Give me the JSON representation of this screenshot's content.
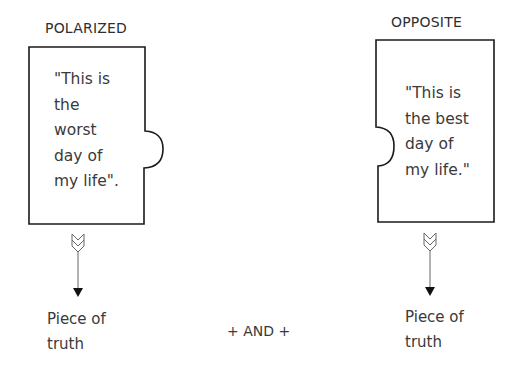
{
  "left": {
    "heading": "POLARIZED",
    "quote_lines": [
      "\"This is",
      "the",
      "worst",
      "day of",
      "my life\"."
    ],
    "result_lines": [
      "Piece of",
      "truth"
    ]
  },
  "right": {
    "heading": "OPPOSITE",
    "quote_lines": [
      "\"This is",
      "the best",
      "day of",
      "my life.\""
    ],
    "result_lines": [
      "Piece of",
      "truth"
    ]
  },
  "connector": "+ AND +",
  "colors": {
    "stroke": "#1a1a1a",
    "text": "#3a3a3a",
    "background": "#ffffff"
  }
}
